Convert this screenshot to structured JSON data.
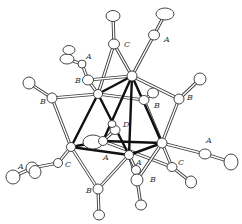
{
  "figure": {
    "type": "ORTEP molecular structure diagram"
  },
  "labels": [
    {
      "id": "lbl-A-top",
      "text": "A",
      "x": 164,
      "y": 42
    },
    {
      "id": "lbl-C-top",
      "text": "C",
      "x": 124,
      "y": 47
    },
    {
      "id": "lbl-A-upperleft",
      "text": "A",
      "x": 86,
      "y": 59
    },
    {
      "id": "lbl-B-upperleft",
      "text": "B",
      "x": 75,
      "y": 83
    },
    {
      "id": "lbl-B-left",
      "text": "B",
      "x": 40,
      "y": 104
    },
    {
      "id": "lbl-B-right",
      "text": "B",
      "x": 187,
      "y": 100
    },
    {
      "id": "lbl-B-center",
      "text": "B",
      "x": 154,
      "y": 108
    },
    {
      "id": "lbl-D",
      "text": "D",
      "x": 123,
      "y": 127
    },
    {
      "id": "lbl-A-right",
      "text": "A",
      "x": 206,
      "y": 143
    },
    {
      "id": "lbl-A-left",
      "text": "A",
      "x": 18,
      "y": 169
    },
    {
      "id": "lbl-C-left",
      "text": "C",
      "x": 65,
      "y": 167
    },
    {
      "id": "lbl-A-center",
      "text": "A",
      "x": 103,
      "y": 160
    },
    {
      "id": "lbl-A-lowercenter",
      "text": "A",
      "x": 136,
      "y": 165
    },
    {
      "id": "lbl-C-right",
      "text": "C",
      "x": 178,
      "y": 165
    },
    {
      "id": "lbl-B-lowerleft",
      "text": "B",
      "x": 86,
      "y": 193
    },
    {
      "id": "lbl-B-lowerright",
      "text": "B",
      "x": 150,
      "y": 182
    }
  ],
  "metals": [
    {
      "id": "M1",
      "x": 132,
      "y": 76,
      "rx": 5,
      "ry": 5
    },
    {
      "id": "M2",
      "x": 98,
      "y": 94,
      "rx": 4.5,
      "ry": 4.5
    },
    {
      "id": "M3",
      "x": 71,
      "y": 147,
      "rx": 4.5,
      "ry": 4.5
    },
    {
      "id": "M4",
      "x": 103,
      "y": 141,
      "rx": 4.5,
      "ry": 4.5
    },
    {
      "id": "M5",
      "x": 129,
      "y": 155,
      "rx": 4.5,
      "ry": 4.5
    },
    {
      "id": "M6",
      "x": 162,
      "y": 143,
      "rx": 5,
      "ry": 5
    }
  ],
  "metal_bonds": [
    [
      "M1",
      "M2"
    ],
    [
      "M1",
      "M4"
    ],
    [
      "M1",
      "M6"
    ],
    [
      "M2",
      "M3"
    ],
    [
      "M2",
      "M5"
    ],
    [
      "M3",
      "M4"
    ],
    [
      "M3",
      "M5"
    ],
    [
      "M4",
      "M6"
    ],
    [
      "M5",
      "M6"
    ],
    [
      "M1",
      "M5"
    ]
  ],
  "ligand_atoms": [
    {
      "id": "C-top",
      "x": 114,
      "y": 44,
      "rx": 5.5,
      "ry": 5
    },
    {
      "id": "O-top",
      "x": 113,
      "y": 16,
      "rx": 7,
      "ry": 5.5
    },
    {
      "id": "C-A-top",
      "x": 154,
      "y": 35,
      "rx": 5.5,
      "ry": 5
    },
    {
      "id": "O-A-top",
      "x": 165,
      "y": 14,
      "rx": 9,
      "ry": 6
    },
    {
      "id": "C-A-ul",
      "x": 82,
      "y": 64,
      "rx": 4,
      "ry": 4
    },
    {
      "id": "O-A-ul",
      "x": 67,
      "y": 59,
      "rx": 7,
      "ry": 5
    },
    {
      "id": "O-A-ul2",
      "x": 69,
      "y": 50,
      "rx": 6,
      "ry": 4.5
    },
    {
      "id": "C-B-ul",
      "x": 88,
      "y": 80,
      "rx": 5.5,
      "ry": 5
    },
    {
      "id": "C-B-l",
      "x": 52,
      "y": 98,
      "rx": 5,
      "ry": 5
    },
    {
      "id": "O-B-l",
      "x": 29,
      "y": 83,
      "rx": 6,
      "ry": 6
    },
    {
      "id": "C-B-r",
      "x": 179,
      "y": 99,
      "rx": 5,
      "ry": 5
    },
    {
      "id": "O-B-r",
      "x": 200,
      "y": 79,
      "rx": 6,
      "ry": 6
    },
    {
      "id": "C-B-c",
      "x": 144,
      "y": 100,
      "rx": 5,
      "ry": 4.5
    },
    {
      "id": "O-B-c",
      "x": 153,
      "y": 93,
      "rx": 5.5,
      "ry": 5
    },
    {
      "id": "C-D",
      "x": 115,
      "y": 130,
      "rx": 5,
      "ry": 4.5
    },
    {
      "id": "O-D",
      "x": 112,
      "y": 124,
      "rx": 4,
      "ry": 3.5
    },
    {
      "id": "C-A-center",
      "x": 93,
      "y": 142,
      "rx": 10,
      "ry": 7
    },
    {
      "id": "C-A-r",
      "x": 205,
      "y": 154,
      "rx": 6,
      "ry": 5
    },
    {
      "id": "O-A-r",
      "x": 231,
      "y": 162,
      "rx": 7,
      "ry": 8
    },
    {
      "id": "C-C-r",
      "x": 172,
      "y": 167,
      "rx": 5,
      "ry": 4.5
    },
    {
      "id": "O-C-r",
      "x": 191,
      "y": 182,
      "rx": 5.5,
      "ry": 6
    },
    {
      "id": "C-C-l",
      "x": 58,
      "y": 163,
      "rx": 4.5,
      "ry": 4.5
    },
    {
      "id": "C-A-l1",
      "x": 32,
      "y": 168,
      "rx": 6,
      "ry": 6
    },
    {
      "id": "O-A-l1",
      "x": 13,
      "y": 177,
      "rx": 7,
      "ry": 7
    },
    {
      "id": "C-A-l2",
      "x": 35,
      "y": 172,
      "rx": 6,
      "ry": 6.5
    },
    {
      "id": "C-A-lc",
      "x": 136,
      "y": 170,
      "rx": 4.5,
      "ry": 4.5
    },
    {
      "id": "C-B-lr",
      "x": 137,
      "y": 180,
      "rx": 6,
      "ry": 6
    },
    {
      "id": "O-B-lr",
      "x": 141,
      "y": 205,
      "rx": 5.5,
      "ry": 5
    },
    {
      "id": "C-B-ll",
      "x": 98,
      "y": 189,
      "rx": 5,
      "ry": 5
    },
    {
      "id": "O-B-ll",
      "x": 99,
      "y": 215,
      "rx": 5.5,
      "ry": 5
    }
  ],
  "ligand_bonds": [
    [
      "C-top",
      "O-top"
    ],
    [
      "M1",
      "C-top"
    ],
    [
      "M2",
      "C-top"
    ],
    [
      "C-A-top",
      "O-A-top"
    ],
    [
      "M1",
      "C-A-top"
    ],
    [
      "C-A-ul",
      "O-A-ul"
    ],
    [
      "C-B-ul",
      "C-A-ul"
    ],
    [
      "M1",
      "C-B-ul"
    ],
    [
      "M2",
      "C-B-ul"
    ],
    [
      "C-B-l",
      "O-B-l"
    ],
    [
      "M2",
      "C-B-l"
    ],
    [
      "M3",
      "C-B-l"
    ],
    [
      "C-B-r",
      "O-B-r"
    ],
    [
      "M1",
      "C-B-r"
    ],
    [
      "M6",
      "C-B-r"
    ],
    [
      "C-B-c",
      "O-B-c"
    ],
    [
      "M2",
      "C-B-c"
    ],
    [
      "M6",
      "C-B-c"
    ],
    [
      "C-D",
      "O-D"
    ],
    [
      "M4",
      "C-D"
    ],
    [
      "M6",
      "C-A-r"
    ],
    [
      "C-A-r",
      "O-A-r"
    ],
    [
      "M6",
      "C-C-r"
    ],
    [
      "C-C-r",
      "O-C-r"
    ],
    [
      "M4",
      "C-C-r"
    ],
    [
      "M3",
      "C-C-l"
    ],
    [
      "C-C-l",
      "C-A-l1"
    ],
    [
      "C-A-l1",
      "O-A-l1"
    ],
    [
      "M3",
      "C-B-ll"
    ],
    [
      "M5",
      "C-B-ll"
    ],
    [
      "C-B-ll",
      "O-B-ll"
    ],
    [
      "M5",
      "C-B-lr"
    ],
    [
      "M6",
      "C-B-lr"
    ],
    [
      "C-B-lr",
      "O-B-lr"
    ],
    [
      "M5",
      "C-A-lc"
    ],
    [
      "M4",
      "C-A-center"
    ]
  ]
}
